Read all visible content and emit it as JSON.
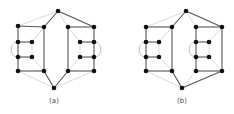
{
  "figure": {
    "panels": [
      {
        "id": "a",
        "label": "(a)",
        "label_pos": [
          54,
          102
        ],
        "nodes": {
          "t": [
            58,
            11
          ],
          "b": [
            54,
            88
          ],
          "L1": [
            18,
            26
          ],
          "L2": [
            44,
            27
          ],
          "L3": [
            18,
            42
          ],
          "L4": [
            32,
            42
          ],
          "L5": [
            18,
            57
          ],
          "L6": [
            32,
            57
          ],
          "L7": [
            18,
            71
          ],
          "L8": [
            44,
            71
          ],
          "R1": [
            68,
            27
          ],
          "R2": [
            94,
            27
          ],
          "R3": [
            80,
            42
          ],
          "R4": [
            94,
            42
          ],
          "R5": [
            80,
            57
          ],
          "R6": [
            94,
            57
          ],
          "R7": [
            68,
            71
          ],
          "R8": [
            94,
            71
          ]
        },
        "dark_edges": [
          [
            "L1",
            "L2"
          ],
          [
            "L1",
            "L3"
          ],
          [
            "L3",
            "L5"
          ],
          [
            "L5",
            "L7"
          ],
          [
            "L7",
            "L8"
          ],
          [
            "L2",
            "L8"
          ],
          [
            "L3",
            "L4"
          ],
          [
            "L5",
            "L6"
          ],
          [
            "R1",
            "R2"
          ],
          [
            "R1",
            "R7"
          ],
          [
            "R7",
            "R8"
          ],
          [
            "R2",
            "R4"
          ],
          [
            "R4",
            "R6"
          ],
          [
            "R6",
            "R8"
          ],
          [
            "R3",
            "R4"
          ],
          [
            "R5",
            "R6"
          ],
          [
            "t",
            "L2"
          ],
          [
            "t",
            "R2"
          ],
          [
            "b",
            "L8"
          ],
          [
            "b",
            "R7"
          ]
        ],
        "light_edges": [
          [
            "t",
            "L1"
          ],
          [
            "t",
            "R1"
          ],
          [
            "b",
            "L7"
          ],
          [
            "b",
            "R8"
          ],
          [
            "L4",
            "L2"
          ],
          [
            "L6",
            "L8"
          ],
          [
            "L4",
            "L6"
          ],
          [
            "R3",
            "R1"
          ],
          [
            "R5",
            "R7"
          ],
          [
            "R3",
            "R5"
          ]
        ],
        "arcs": [
          {
            "from": "L3",
            "to": "L5",
            "side": "left"
          },
          {
            "from": "R4",
            "to": "R6",
            "side": "right"
          }
        ]
      },
      {
        "id": "b",
        "label": "(b)",
        "label_pos": [
          182,
          102
        ],
        "nodes": {
          "t": [
            186,
            11
          ],
          "b": [
            182,
            88
          ],
          "L1": [
            146,
            27
          ],
          "L2": [
            172,
            27
          ],
          "L3": [
            146,
            42
          ],
          "L4": [
            159,
            42
          ],
          "L5": [
            146,
            57
          ],
          "L6": [
            159,
            57
          ],
          "L7": [
            146,
            71
          ],
          "L8": [
            172,
            71
          ],
          "R1": [
            196,
            27
          ],
          "R2": [
            222,
            27
          ],
          "R3": [
            196,
            42
          ],
          "R4": [
            209,
            42
          ],
          "R5": [
            196,
            57
          ],
          "R6": [
            209,
            57
          ],
          "R7": [
            196,
            71
          ],
          "R8": [
            222,
            71
          ]
        },
        "dark_edges": [
          [
            "L1",
            "L2"
          ],
          [
            "L1",
            "L3"
          ],
          [
            "L3",
            "L5"
          ],
          [
            "L5",
            "L7"
          ],
          [
            "L7",
            "L8"
          ],
          [
            "L2",
            "L8"
          ],
          [
            "L3",
            "L4"
          ],
          [
            "L5",
            "L6"
          ],
          [
            "R1",
            "R2"
          ],
          [
            "R1",
            "R3"
          ],
          [
            "R3",
            "R5"
          ],
          [
            "R5",
            "R7"
          ],
          [
            "R7",
            "R8"
          ],
          [
            "R2",
            "R8"
          ],
          [
            "R3",
            "R4"
          ],
          [
            "R5",
            "R6"
          ],
          [
            "t",
            "L2"
          ],
          [
            "t",
            "R2"
          ],
          [
            "b",
            "L8"
          ],
          [
            "b",
            "R8"
          ]
        ],
        "light_edges": [
          [
            "t",
            "L1"
          ],
          [
            "t",
            "R1"
          ],
          [
            "b",
            "L7"
          ],
          [
            "b",
            "R7"
          ],
          [
            "L4",
            "L2"
          ],
          [
            "L6",
            "L8"
          ],
          [
            "L4",
            "L6"
          ],
          [
            "R4",
            "R2"
          ],
          [
            "R6",
            "R8"
          ],
          [
            "R4",
            "R6"
          ]
        ],
        "arcs": [
          {
            "from": "L3",
            "to": "L5",
            "side": "left"
          },
          {
            "from": "R3",
            "to": "R5",
            "side": "left"
          }
        ]
      }
    ],
    "colors": {
      "node": "#111111",
      "dark_edge": "#555555",
      "light_edge": "#c8c8c8",
      "arc": "#aaaaaa"
    }
  }
}
